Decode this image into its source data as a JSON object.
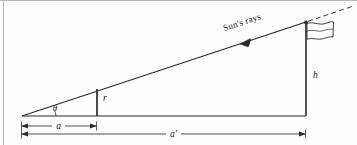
{
  "figure": {
    "title_alt": "Sun's rays incidence angle diagram with gnomon and flagpole",
    "labels": {
      "sun_rays": "Sun's rays",
      "angle_theta": "θ",
      "gnomon_height": "r",
      "pole_height": "h",
      "short_base": "a",
      "long_base": "a′"
    },
    "colors": {
      "line": "#2b2b2b",
      "thin_line": "#3a3a3a",
      "frame": "#b9b9b9",
      "background": "#fefefe",
      "text": "#1a1a1a"
    },
    "geometry": {
      "apex_x": 22,
      "apex_y": 116,
      "pole_base_x": 306,
      "pole_top_y": 22,
      "gnomon_x": 97,
      "gnomon_top_y": 89,
      "baseline_y": 116,
      "dim_a_y": 126,
      "dim_aprime_y": 134
    }
  }
}
